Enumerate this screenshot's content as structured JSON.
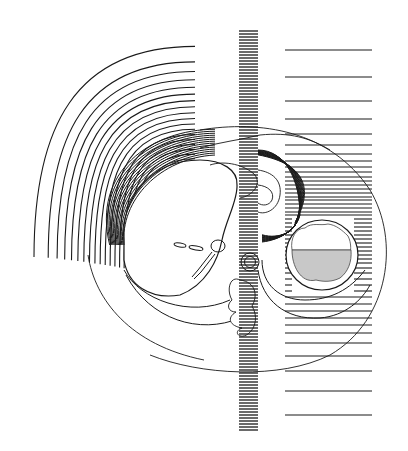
{
  "figure": {
    "width": 408,
    "height": 451,
    "background": "#ffffff",
    "ink": "#1a1a1a",
    "shading": "#c8c8c8",
    "text_labels": []
  },
  "left_arcs": {
    "center": [
      232,
      262
    ],
    "count": 20,
    "radii_outer": 220,
    "radii_inner": 96,
    "start_angle_deg": 180,
    "end_angle_deg": 270
  },
  "vertical_band": {
    "x": 239,
    "width": 19,
    "y_top": 31,
    "y_bottom": 431,
    "line_spacing": 3
  },
  "right_panel": {
    "x_left": 285,
    "x_right": 372,
    "line_ys": [
      50,
      77,
      101,
      119,
      134,
      145,
      154,
      161,
      167,
      172,
      177,
      181,
      185,
      189,
      193,
      197,
      200,
      204,
      208,
      212,
      215,
      219,
      223,
      227,
      231,
      235,
      239,
      243,
      247,
      251,
      255,
      259,
      263,
      268,
      273,
      279,
      285,
      291,
      297,
      304,
      311,
      318,
      325,
      333,
      343,
      356,
      371,
      391,
      415
    ]
  },
  "organs": {
    "body_outline": "large ellipse outline enclosing thorax",
    "liver": "large rounded shape left of center",
    "stomach_fluid_level": "circle at right with shaded lower half",
    "aorta": "small double circle near center",
    "spine": "irregular vertebral outline below aorta"
  }
}
